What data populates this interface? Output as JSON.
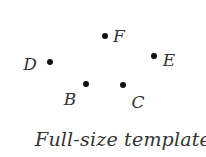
{
  "diagram": {
    "points": [
      {
        "label": "F",
        "dot": [
          105,
          36
        ],
        "label_pos": [
          119,
          36
        ]
      },
      {
        "label": "D",
        "dot": [
          50,
          62
        ],
        "label_pos": [
          30,
          64
        ]
      },
      {
        "label": "E",
        "dot": [
          154,
          56
        ],
        "label_pos": [
          169,
          60
        ]
      },
      {
        "label": "B",
        "dot": [
          86,
          84
        ],
        "label_pos": [
          70,
          99
        ]
      },
      {
        "label": "C",
        "dot": [
          123,
          85
        ],
        "label_pos": [
          138,
          102
        ]
      }
    ],
    "caption": "Full-size template",
    "colors": {
      "dot": "#111111",
      "text": "#333333",
      "background": "#ffffff"
    }
  }
}
